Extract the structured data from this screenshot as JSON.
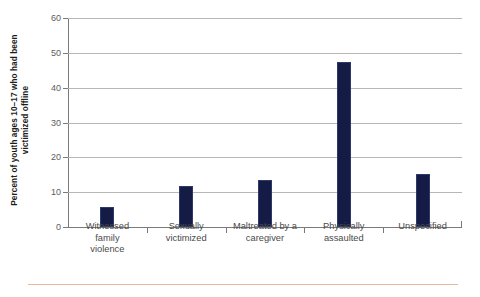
{
  "chart_data": {
    "type": "bar",
    "title": "",
    "subtitle": "",
    "xlabel": "",
    "ylabel": "Percent of youth ages 10–17 who had been victimized offline",
    "ylabel_lines": [
      "Percent of youth ages 10–17 who had been",
      "victimized offline"
    ],
    "categories": [
      "Witnessed\nfamily\nviolence",
      "Sexually\nvictimized",
      "Maltreated by a\ncaregiver",
      "Physically\nassaulted",
      "Unspecified"
    ],
    "values": [
      5.8,
      11.8,
      13.5,
      47.5,
      15.2
    ],
    "ylim": [
      0,
      60
    ],
    "yticks": [
      0,
      10,
      20,
      30,
      40,
      50,
      60
    ],
    "ytick_labels": [
      "0",
      "10",
      "20",
      "30",
      "40",
      "50",
      "60"
    ],
    "grid": true,
    "legend": "none",
    "bar_color": "#141c46",
    "gridline_color": "#b7b7b7",
    "axis_color": "#7a7a7a",
    "accent_rule_color": "#e7b89c",
    "background": "#ffffff"
  }
}
